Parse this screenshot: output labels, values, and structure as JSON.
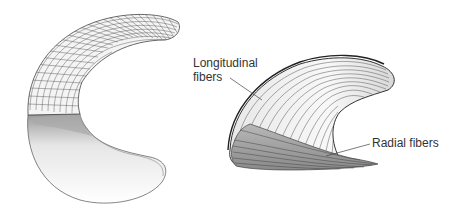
{
  "figure": {
    "left_shape": "C-shaped crescent with grid mesh (upper) and shaded smooth surface (lower)",
    "right_shape": "3D horn-shaped structure with fiber lines"
  },
  "labels": {
    "longitudinal_line1": "Longitudinal",
    "longitudinal_line2": "fibers",
    "radial": "Radial fibers"
  },
  "colors": {
    "line": "#333333",
    "mesh": "#555555",
    "shade": "#bbbbbb"
  }
}
